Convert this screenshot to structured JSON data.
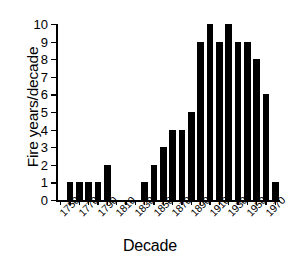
{
  "chart_data": {
    "type": "bar",
    "title": "",
    "xlabel": "Decade",
    "ylabel": "Fire years/decade",
    "categories": [
      "1750",
      "1760",
      "1770",
      "1780",
      "1790",
      "1800",
      "1810",
      "1820",
      "1830",
      "1840",
      "1850",
      "1860",
      "1870",
      "1880",
      "1890",
      "1900",
      "1910",
      "1920",
      "1930",
      "1940",
      "1950",
      "1960",
      "1970",
      "1980"
    ],
    "values": [
      0,
      1,
      1,
      1,
      1,
      2,
      0,
      0,
      0,
      1,
      2,
      3,
      4,
      4,
      5,
      9,
      10,
      9,
      10,
      9,
      9,
      8,
      6,
      1
    ],
    "ylim": [
      0,
      10
    ],
    "ytick_labels": [
      "0",
      "1",
      "2",
      "3",
      "4",
      "5",
      "6",
      "7",
      "8",
      "9",
      "10"
    ],
    "xtick_labels": [
      "1750",
      "1770",
      "1790",
      "1810",
      "1830",
      "1850",
      "1870",
      "1890",
      "1910",
      "1930",
      "1950",
      "1970"
    ],
    "xtick_step_decades": 2,
    "grid": false,
    "legend": false,
    "bar_color": "#000000",
    "axis_color": "#000000",
    "background_color": "#ffffff"
  }
}
